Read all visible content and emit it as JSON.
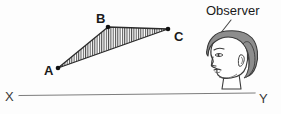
{
  "figure": {
    "name": "triangle-observer-horizon-diagram",
    "background_color": "#fdfdfd",
    "width": 281,
    "height": 114
  },
  "triangle": {
    "name": "hatched-triangle-ABC",
    "outline_color": "#2b2b2b",
    "hatch_color": "#555555",
    "fill_color": "#ffffff",
    "vertices": [
      {
        "label": "A",
        "x": 58,
        "y": 68,
        "label_x": 44,
        "label_y": 75
      },
      {
        "label": "B",
        "x": 108,
        "y": 27,
        "label_x": 96,
        "label_y": 23
      },
      {
        "label": "C",
        "x": 168,
        "y": 29,
        "label_x": 174,
        "label_y": 41
      }
    ]
  },
  "observer": {
    "name": "observer-head",
    "callout_label": "Observer",
    "callout_x": 206,
    "callout_y": 15,
    "hair_color": "#8d8d8d",
    "hair_outline_color": "#3b3b3b",
    "face_color": "#fefefe",
    "face_outline_color": "#3b3b3b",
    "leader_line_color": "#4a4a4a"
  },
  "horizon": {
    "name": "horizon-line-XY",
    "line_color": "#7d7d7d",
    "start_label": "X",
    "end_label": "Y",
    "start_x": 19,
    "start_y": 95,
    "end_x": 255,
    "end_y": 93,
    "start_label_x": 5,
    "start_label_y": 101,
    "end_label_x": 259,
    "end_label_y": 103
  }
}
